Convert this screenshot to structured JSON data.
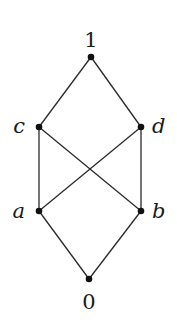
{
  "diagram": {
    "type": "hasse-diagram",
    "nodes": [
      {
        "id": "1",
        "label": "1",
        "x": 91,
        "y": 57,
        "lx": 91,
        "ly": 47,
        "anchor": "middle",
        "italic": false
      },
      {
        "id": "c",
        "label": "c",
        "x": 39,
        "y": 127,
        "lx": 25,
        "ly": 133,
        "anchor": "end",
        "italic": true
      },
      {
        "id": "d",
        "label": "d",
        "x": 141,
        "y": 127,
        "lx": 152,
        "ly": 133,
        "anchor": "start",
        "italic": true
      },
      {
        "id": "a",
        "label": "a",
        "x": 39,
        "y": 211,
        "lx": 25,
        "ly": 218,
        "anchor": "end",
        "italic": true
      },
      {
        "id": "b",
        "label": "b",
        "x": 141,
        "y": 211,
        "lx": 152,
        "ly": 218,
        "anchor": "start",
        "italic": true
      },
      {
        "id": "0",
        "label": "0",
        "x": 89,
        "y": 279,
        "lx": 89,
        "ly": 309,
        "anchor": "middle",
        "italic": false
      }
    ],
    "edges": [
      [
        "1",
        "c"
      ],
      [
        "1",
        "d"
      ],
      [
        "c",
        "a"
      ],
      [
        "c",
        "b"
      ],
      [
        "d",
        "a"
      ],
      [
        "d",
        "b"
      ],
      [
        "a",
        "0"
      ],
      [
        "b",
        "0"
      ]
    ],
    "colors": {
      "line": "#2a2a2a",
      "node": "#111111",
      "text": "#1a1a1a"
    }
  }
}
